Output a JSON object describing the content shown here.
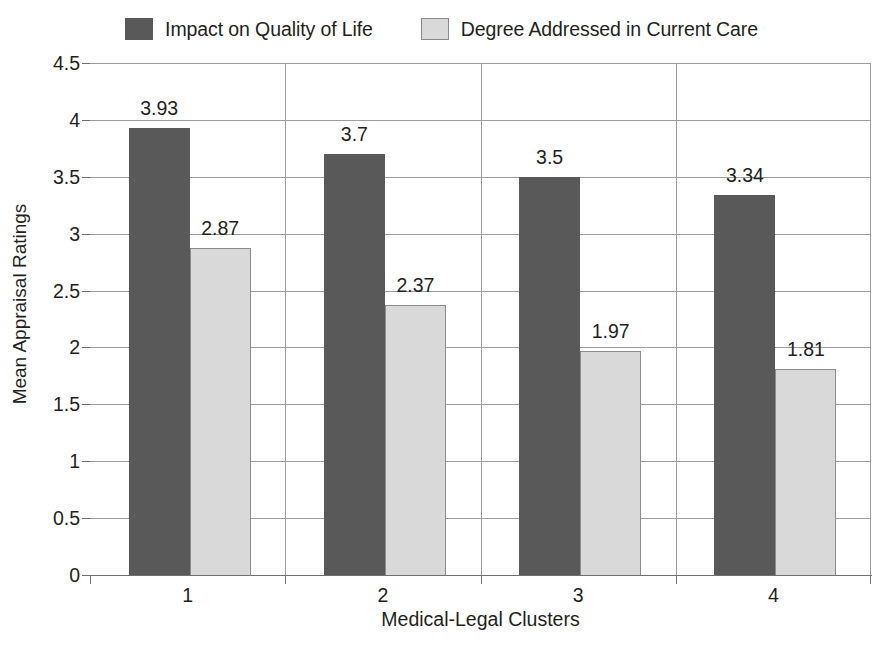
{
  "chart_data": {
    "type": "bar",
    "title": "",
    "xlabel": "Medical-Legal Clusters",
    "ylabel": "Mean Appraisal Ratings",
    "categories": [
      "1",
      "2",
      "3",
      "4"
    ],
    "series": [
      {
        "name": "Impact on Quality of Life",
        "color": "#595959",
        "values": [
          3.93,
          3.7,
          3.5,
          3.34
        ],
        "labels": [
          "3.93",
          "3.7",
          "3.5",
          "3.34"
        ]
      },
      {
        "name": "Degree Addressed in Current Care",
        "color": "#d9d9d9",
        "values": [
          2.87,
          2.37,
          1.97,
          1.81
        ],
        "labels": [
          "2.87",
          "2.37",
          "1.97",
          "1.81"
        ]
      }
    ],
    "ylim": [
      0,
      4.5
    ],
    "ytick_step": 0.5,
    "ytick_labels": [
      "4.5",
      "4",
      "3.5",
      "3",
      "2.5",
      "2",
      "1.5",
      "1",
      "0.5",
      "0"
    ],
    "ytick_values": [
      4.5,
      4,
      3.5,
      3,
      2.5,
      2,
      1.5,
      1,
      0.5,
      0
    ],
    "grid": true,
    "legend_position": "top-center",
    "bar_outline_color": "#8c8c8c",
    "gridline_color": "#9c9c9c",
    "axis_color": "#6f6f6f",
    "text_color": "#231f20",
    "background": "#ffffff"
  },
  "legend": {
    "entries": [
      {
        "label": "Impact on Quality of Life",
        "swatch": "dark"
      },
      {
        "label": "Degree Addressed in Current Care",
        "swatch": "light"
      }
    ]
  }
}
